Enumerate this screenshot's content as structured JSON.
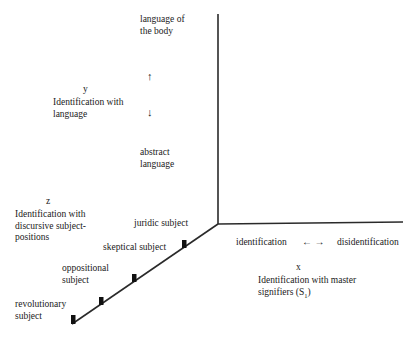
{
  "y_axis": {
    "letter": "y",
    "title_line1": "Identification with",
    "title_line2": "language",
    "top_label_line1": "language of",
    "top_label_line2": "the body",
    "up_arrow": "↑",
    "down_arrow": "↓",
    "bottom_label_line1": "abstract",
    "bottom_label_line2": "language"
  },
  "z_axis": {
    "letter": "z",
    "title_line1": "Identification with",
    "title_line2": "discursive subject-",
    "title_line3": "positions",
    "positions": [
      {
        "line1": "juridic subject"
      },
      {
        "line1": "skeptical subject"
      },
      {
        "line1": "oppositional",
        "line2": "subject"
      },
      {
        "line1": "revolutionary",
        "line2": "subject"
      }
    ]
  },
  "x_axis": {
    "letter": "x",
    "left_label": "identification",
    "arrows": "← →",
    "right_label": "disidentification",
    "title_line1": "Identification with master",
    "title_line2": "signifiers (S",
    "title_subscript": "1",
    "title_close": ")"
  }
}
